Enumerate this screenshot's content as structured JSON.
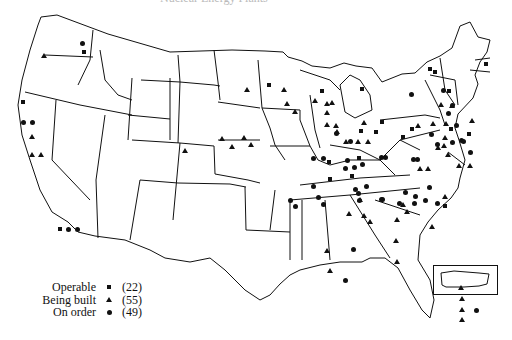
{
  "figure": {
    "title_cut": "Nuclear Energy Plants"
  },
  "legend": {
    "items": [
      {
        "label": "Operable",
        "symbol": "square",
        "count": "(22)"
      },
      {
        "label": "Being built",
        "symbol": "triangle",
        "count": "(55)"
      },
      {
        "label": "On order",
        "symbol": "circle",
        "count": "(49)"
      }
    ]
  },
  "inset": {
    "name": "Puerto Rico",
    "markers": [
      {
        "type": "circle"
      }
    ]
  },
  "markers": {
    "squares": [
      [
        84,
        52
      ],
      [
        23,
        102
      ],
      [
        60,
        229
      ],
      [
        269,
        85
      ],
      [
        322,
        91
      ],
      [
        362,
        89
      ],
      [
        382,
        122
      ],
      [
        359,
        158
      ],
      [
        361,
        131
      ],
      [
        376,
        132
      ],
      [
        329,
        162
      ],
      [
        330,
        179
      ],
      [
        352,
        176
      ],
      [
        430,
        69
      ],
      [
        435,
        72
      ],
      [
        449,
        91
      ],
      [
        412,
        129
      ],
      [
        403,
        137
      ],
      [
        451,
        129
      ],
      [
        445,
        206
      ],
      [
        486,
        64
      ],
      [
        469,
        134
      ]
    ],
    "triangles": [
      [
        43,
        55
      ],
      [
        31,
        136
      ],
      [
        31,
        154
      ],
      [
        40,
        154
      ],
      [
        184,
        150
      ],
      [
        221,
        138
      ],
      [
        231,
        146
      ],
      [
        243,
        137
      ],
      [
        250,
        144
      ],
      [
        246,
        89
      ],
      [
        283,
        89
      ],
      [
        286,
        103
      ],
      [
        294,
        111
      ],
      [
        314,
        100
      ],
      [
        326,
        103
      ],
      [
        326,
        112
      ],
      [
        326,
        124
      ],
      [
        331,
        102
      ],
      [
        357,
        141
      ],
      [
        367,
        141
      ],
      [
        363,
        122
      ],
      [
        335,
        125
      ],
      [
        336,
        131
      ],
      [
        345,
        141
      ],
      [
        329,
        270
      ],
      [
        326,
        250
      ],
      [
        402,
        204
      ],
      [
        359,
        199
      ],
      [
        363,
        215
      ],
      [
        369,
        221
      ],
      [
        348,
        213
      ],
      [
        396,
        219
      ],
      [
        396,
        261
      ],
      [
        419,
        168
      ],
      [
        427,
        168
      ],
      [
        440,
        104
      ],
      [
        451,
        105
      ],
      [
        445,
        123
      ],
      [
        417,
        125
      ],
      [
        432,
        123
      ],
      [
        444,
        137
      ],
      [
        443,
        145
      ],
      [
        447,
        154
      ],
      [
        469,
        165
      ],
      [
        458,
        165
      ],
      [
        471,
        120
      ],
      [
        437,
        147
      ],
      [
        444,
        196
      ],
      [
        431,
        226
      ],
      [
        406,
        211
      ],
      [
        395,
        240
      ],
      [
        460,
        287
      ],
      [
        461,
        298
      ],
      [
        461,
        309
      ],
      [
        461,
        319
      ]
    ],
    "circles": [
      [
        82,
        43
      ],
      [
        23,
        122
      ],
      [
        32,
        122
      ],
      [
        68,
        229
      ],
      [
        77,
        229
      ],
      [
        295,
        206
      ],
      [
        290,
        200
      ],
      [
        313,
        186
      ],
      [
        318,
        197
      ],
      [
        323,
        204
      ],
      [
        336,
        133
      ],
      [
        350,
        141
      ],
      [
        345,
        168
      ],
      [
        347,
        160
      ],
      [
        354,
        167
      ],
      [
        362,
        164
      ],
      [
        381,
        157
      ],
      [
        385,
        157
      ],
      [
        313,
        158
      ],
      [
        323,
        158
      ],
      [
        355,
        189
      ],
      [
        358,
        193
      ],
      [
        366,
        186
      ],
      [
        359,
        200
      ],
      [
        381,
        199
      ],
      [
        382,
        199
      ],
      [
        399,
        203
      ],
      [
        405,
        192
      ],
      [
        415,
        196
      ],
      [
        414,
        203
      ],
      [
        425,
        200
      ],
      [
        437,
        203
      ],
      [
        429,
        187
      ],
      [
        456,
        125
      ],
      [
        461,
        140
      ],
      [
        463,
        141
      ],
      [
        470,
        152
      ],
      [
        437,
        144
      ],
      [
        452,
        142
      ],
      [
        448,
        113
      ],
      [
        452,
        105
      ],
      [
        443,
        90
      ],
      [
        411,
        94
      ],
      [
        431,
        134
      ],
      [
        413,
        159
      ],
      [
        417,
        159
      ],
      [
        345,
        280
      ],
      [
        353,
        249
      ],
      [
        476,
        310
      ]
    ]
  }
}
